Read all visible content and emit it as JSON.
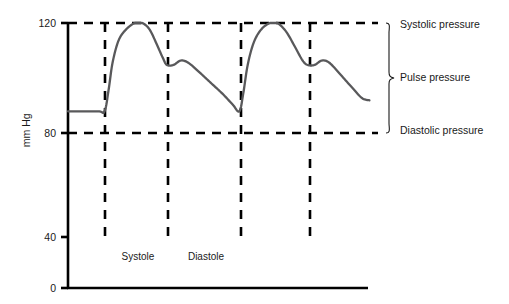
{
  "chart_data": {
    "type": "line",
    "title": "",
    "xlabel": "",
    "ylabel": "mm Hg",
    "ylim": [
      0,
      120
    ],
    "xlim": [
      0,
      100
    ],
    "grid": false,
    "legend_position": "right-brace",
    "y_ticks": [
      {
        "value": 120,
        "label": "120"
      },
      {
        "value": 80,
        "label": "80"
      },
      {
        "value": 40,
        "label": "40"
      },
      {
        "value": 0,
        "label": "0"
      }
    ],
    "x_ticks": [],
    "reference_lines": [
      {
        "name": "systolic",
        "value": 120,
        "orientation": "horizontal",
        "style": "dashed"
      },
      {
        "name": "diastolic",
        "value": 80,
        "orientation": "horizontal",
        "style": "dashed"
      }
    ],
    "event_markers": [
      {
        "name": "systole-start",
        "x": 12.3,
        "style": "dashed"
      },
      {
        "name": "systole-end-dicrotic-notch",
        "x": 33.3,
        "style": "dashed"
      },
      {
        "name": "next-systole-start",
        "x": 57.7,
        "style": "dashed"
      },
      {
        "name": "next-dicrotic-notch",
        "x": 80.7,
        "style": "dashed"
      }
    ],
    "series": [
      {
        "name": "Arterial blood pressure",
        "color": "#59595b",
        "points": [
          {
            "x": 0.0,
            "y": 80
          },
          {
            "x": 10.0,
            "y": 80
          },
          {
            "x": 12.3,
            "y": 80
          },
          {
            "x": 13.7,
            "y": 90
          },
          {
            "x": 15.0,
            "y": 102
          },
          {
            "x": 17.0,
            "y": 112
          },
          {
            "x": 19.5,
            "y": 117
          },
          {
            "x": 22.5,
            "y": 120
          },
          {
            "x": 25.0,
            "y": 120
          },
          {
            "x": 27.5,
            "y": 117
          },
          {
            "x": 30.0,
            "y": 110
          },
          {
            "x": 32.0,
            "y": 104
          },
          {
            "x": 33.3,
            "y": 101
          },
          {
            "x": 35.5,
            "y": 101
          },
          {
            "x": 38.0,
            "y": 103
          },
          {
            "x": 40.5,
            "y": 102
          },
          {
            "x": 44.0,
            "y": 98
          },
          {
            "x": 48.0,
            "y": 93
          },
          {
            "x": 52.0,
            "y": 88
          },
          {
            "x": 55.5,
            "y": 83
          },
          {
            "x": 57.7,
            "y": 80
          },
          {
            "x": 59.0,
            "y": 88
          },
          {
            "x": 60.5,
            "y": 101
          },
          {
            "x": 62.5,
            "y": 111
          },
          {
            "x": 65.0,
            "y": 117
          },
          {
            "x": 68.0,
            "y": 120
          },
          {
            "x": 70.5,
            "y": 120
          },
          {
            "x": 73.5,
            "y": 116
          },
          {
            "x": 76.5,
            "y": 109
          },
          {
            "x": 79.0,
            "y": 103
          },
          {
            "x": 80.7,
            "y": 101
          },
          {
            "x": 83.0,
            "y": 101
          },
          {
            "x": 85.5,
            "y": 103
          },
          {
            "x": 88.0,
            "y": 102
          },
          {
            "x": 91.5,
            "y": 97
          },
          {
            "x": 95.5,
            "y": 91
          },
          {
            "x": 99.0,
            "y": 86
          },
          {
            "x": 101.5,
            "y": 85
          }
        ]
      }
    ],
    "annotations": [
      {
        "name": "systolic-pressure",
        "text": "Systolic pressure",
        "at_value": 120
      },
      {
        "name": "pulse-pressure",
        "text": "Pulse pressure",
        "at_value": 100
      },
      {
        "name": "diastolic-pressure",
        "text": "Diastolic pressure",
        "at_value": 80
      }
    ],
    "phase_labels": [
      {
        "name": "systole",
        "text": "Systole",
        "x_center": 27.0
      },
      {
        "name": "diastole",
        "text": "Diastole",
        "x_center": 50.5
      }
    ],
    "colors": {
      "curve": "#59595b",
      "axis": "#000000",
      "dashed": "#000000",
      "text": "#1a1a1a"
    }
  }
}
